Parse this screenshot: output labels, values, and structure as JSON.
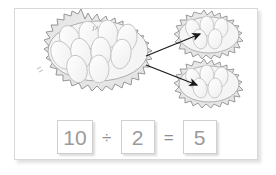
{
  "card": {
    "background_color": "#ffffff",
    "border_color": "#d8d8d8"
  },
  "illustration": {
    "title": "division-of-eggs-into-nests",
    "nest_outline_color": "#8c8c8c",
    "nest_fill_color": "#ebebeb",
    "egg_fill_color": "#fafafa",
    "egg_outline_color": "#bdbdbd",
    "arrow_color": "#1a1a1a",
    "big_nest": {
      "name": "big-nest",
      "egg_count": 10,
      "label": "nest with 10 eggs"
    },
    "small_nest_top": {
      "name": "small-nest-top",
      "egg_count": 5,
      "label": "nest with 5 eggs"
    },
    "small_nest_bottom": {
      "name": "small-nest-bottom",
      "egg_count": 5,
      "label": "nest with 5 eggs"
    },
    "arrows": [
      {
        "name": "arrow-to-top-nest",
        "label": "arrow pointing to top right nest"
      },
      {
        "name": "arrow-to-bottom-nest",
        "label": "arrow pointing to bottom right nest"
      }
    ]
  },
  "equation": {
    "dividend": "10",
    "divide_symbol": "÷",
    "divisor": "2",
    "equals_symbol": "=",
    "quotient": "5",
    "digit_color": "#9a9a9a",
    "box_border_color": "#cfcfcf"
  }
}
